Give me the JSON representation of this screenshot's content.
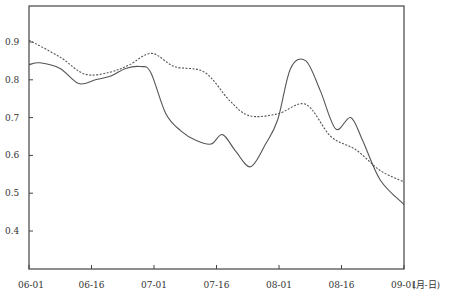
{
  "chart_data": {
    "type": "line",
    "title": "",
    "xlabel": "(月-日)",
    "ylabel": "",
    "ylim": [
      0.3,
      1.0
    ],
    "grid": false,
    "legend": null,
    "x_ticks": [
      "06-01",
      "06-16",
      "07-01",
      "07-16",
      "08-01",
      "08-16",
      "09-01"
    ],
    "y_ticks": [
      0.4,
      0.5,
      0.6,
      0.7,
      0.8,
      0.9
    ],
    "y_tick_labels": [
      "0.4",
      "0.5",
      "0.6",
      "0.7",
      "0.8",
      "0.9"
    ],
    "series": [
      {
        "name": "solid",
        "style": "solid",
        "color": "#555555",
        "x": [
          0,
          3.6,
          10.2,
          16.3,
          21.8,
          26.9,
          31.7,
          36.6,
          39.9,
          44.9,
          49.8,
          54.7,
          59.7,
          63.5,
          67.9,
          72.7,
          77.6,
          81.6,
          85.8,
          90.8,
          95.6,
          100.6,
          105.5,
          109.4,
          115.2,
          123.0
        ],
        "values": [
          0.84,
          0.845,
          0.83,
          0.79,
          0.8,
          0.81,
          0.83,
          0.835,
          0.82,
          0.71,
          0.665,
          0.64,
          0.63,
          0.655,
          0.61,
          0.57,
          0.63,
          0.695,
          0.83,
          0.85,
          0.77,
          0.67,
          0.7,
          0.64,
          0.535,
          0.47
        ]
      },
      {
        "name": "dashed",
        "style": "dashed",
        "color": "#555555",
        "x": [
          0,
          10.2,
          18.3,
          26.5,
          33.0,
          40.2,
          47.7,
          57.6,
          65.8,
          72.3,
          81.6,
          90.8,
          99.0,
          107.2,
          115.2,
          123.0
        ],
        "values": [
          0.905,
          0.86,
          0.815,
          0.82,
          0.84,
          0.87,
          0.835,
          0.82,
          0.745,
          0.705,
          0.71,
          0.735,
          0.65,
          0.615,
          0.56,
          0.53
        ]
      }
    ]
  },
  "axis": {
    "x_unit_label": "(月-日)"
  }
}
